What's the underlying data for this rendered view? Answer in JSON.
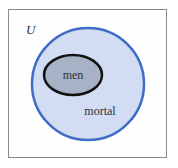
{
  "diagram": {
    "type": "venn",
    "universe": {
      "label": "U",
      "border_color": "#8a8a8a"
    },
    "sets": [
      {
        "id": "mortal",
        "label": "mortal",
        "fill": "#d2ddf3",
        "stroke": "#3d6bc6",
        "contains": [
          "men"
        ]
      },
      {
        "id": "men",
        "label": "men",
        "fill": "#a8b2c6",
        "stroke": "#111111",
        "subset_of": "mortal"
      }
    ]
  }
}
